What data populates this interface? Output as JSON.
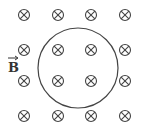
{
  "diagram": {
    "title": "",
    "field_label": "B",
    "field_symbol": "into-page-cross",
    "stroke_color": "#444444",
    "grid": {
      "columns_x": [
        24,
        58,
        91,
        125
      ],
      "rows_y": [
        15,
        50,
        81,
        116
      ]
    },
    "circle": {
      "cx": 78,
      "cy": 68,
      "r": 40
    }
  }
}
